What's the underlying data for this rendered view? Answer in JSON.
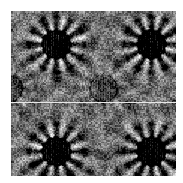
{
  "figure": {
    "kind": "texture-plate",
    "width": 183,
    "height": 183,
    "background_color": "#ffffff"
  },
  "plate": {
    "left": 11,
    "top": 11,
    "width": 165,
    "height": 165,
    "base_color": "#6e6e6e",
    "dark_color": "#2a2a2a",
    "light_color": "#c8c8c8",
    "mean_gray": "#6e6e6e",
    "grain_cell_px": 1.5,
    "grain_amplitude": 46
  },
  "seam": {
    "present": true,
    "orientation": "horizontal",
    "y_in_plate": 91,
    "y_in_image": 102,
    "color": "#e8e8e8",
    "thickness": 1
  },
  "motifs": {
    "description": "Radial sunburst / mandala rosettes arranged on a 2x2 lattice with one central rosette",
    "count": 5,
    "symmetry_order": 12,
    "items": [
      {
        "name": "rosette-top-left",
        "cx": 45,
        "cy": 33,
        "radius": 22,
        "ring_radius": 14
      },
      {
        "name": "rosette-top-right",
        "cx": 140,
        "cy": 33,
        "radius": 22,
        "ring_radius": 14
      },
      {
        "name": "rosette-center",
        "cx": 92,
        "cy": 77,
        "radius": 22,
        "ring_radius": 14
      },
      {
        "name": "rosette-bottom-left",
        "cx": 45,
        "cy": 140,
        "radius": 22,
        "ring_radius": 14
      },
      {
        "name": "rosette-bottom-right",
        "cx": 140,
        "cy": 140,
        "radius": 22,
        "ring_radius": 14
      }
    ]
  },
  "lattice": {
    "period_x": 95,
    "period_y": 107,
    "offset_x": 45,
    "offset_y": 33
  },
  "chart_data": {
    "type": "heatmap",
    "subtitle": "",
    "xlabel": "",
    "ylabel": "",
    "grid": false,
    "legend": "none",
    "colormap": "gray",
    "value_range": [
      0,
      255
    ],
    "xlim": [
      0,
      165
    ],
    "ylim": [
      0,
      165
    ],
    "tick_labels_x": [],
    "tick_labels_y": [],
    "annotations": [],
    "feature_points": [
      {
        "label": "rosette-top-left",
        "x": 45,
        "y": 33,
        "value": 58
      },
      {
        "label": "rosette-top-right",
        "x": 140,
        "y": 33,
        "value": 58
      },
      {
        "label": "rosette-center",
        "x": 92,
        "y": 77,
        "value": 58
      },
      {
        "label": "rosette-bottom-left",
        "x": 45,
        "y": 140,
        "value": 58
      },
      {
        "label": "rosette-bottom-right",
        "x": 140,
        "y": 140,
        "value": 58
      },
      {
        "label": "seam-line",
        "x": 82,
        "y": 91,
        "value": 232
      }
    ]
  }
}
